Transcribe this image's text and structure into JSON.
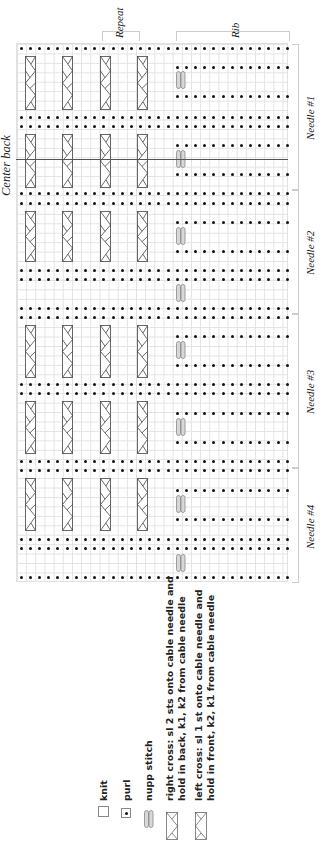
{
  "labels": {
    "center_back": "Center back",
    "repeat": "Repeat",
    "rib": "Rib"
  },
  "needles": [
    {
      "label": "Needle #1",
      "top": 43,
      "bottom": 189
    },
    {
      "label": "Needle #2",
      "top": 189,
      "bottom": 313
    },
    {
      "label": "Needle #3",
      "top": 313,
      "bottom": 467
    },
    {
      "label": "Needle #4",
      "top": 467,
      "bottom": 582
    }
  ],
  "legend": [
    {
      "symbol": "knit-icon",
      "label": "knit"
    },
    {
      "symbol": "purl-icon",
      "label": "purl"
    },
    {
      "symbol": "nupp-icon",
      "label": "nupp stitch"
    },
    {
      "symbol": "right-cross-icon",
      "label": "right cross: sl 2 sts onto cable needle and",
      "label2": "hold in back, k1, k2 from cable needle"
    },
    {
      "symbol": "left-cross-icon",
      "label": "left cross: sl 1 st onto cable needle and",
      "label2": "hold in front, k2, k1 from cable needle"
    }
  ],
  "chart": {
    "columns": 30,
    "full_purl_rows_y": [
      48,
      117,
      126,
      193,
      203,
      270,
      279,
      308,
      317,
      384,
      393,
      461,
      470,
      539,
      548,
      577
    ],
    "partial_purl_rows_y": [
      67,
      96,
      145,
      174,
      222,
      251,
      336,
      365,
      413,
      442,
      490,
      519
    ],
    "partial_start_col": 17,
    "nupp_y": [
      80,
      159,
      236,
      293,
      350,
      427,
      504,
      563
    ],
    "nupp_x": 176,
    "cable_cols_x": [
      25,
      62,
      100,
      137
    ],
    "cable_blocks": [
      [
        56,
        110
      ],
      [
        134,
        188
      ],
      [
        211,
        262
      ],
      [
        325,
        378
      ],
      [
        401,
        454
      ],
      [
        478,
        531
      ]
    ],
    "center_line_y": 159,
    "colors": {
      "grid": "#e2e2e2",
      "ink": "#111111",
      "nupp_fill": "#d8d8d8"
    }
  }
}
